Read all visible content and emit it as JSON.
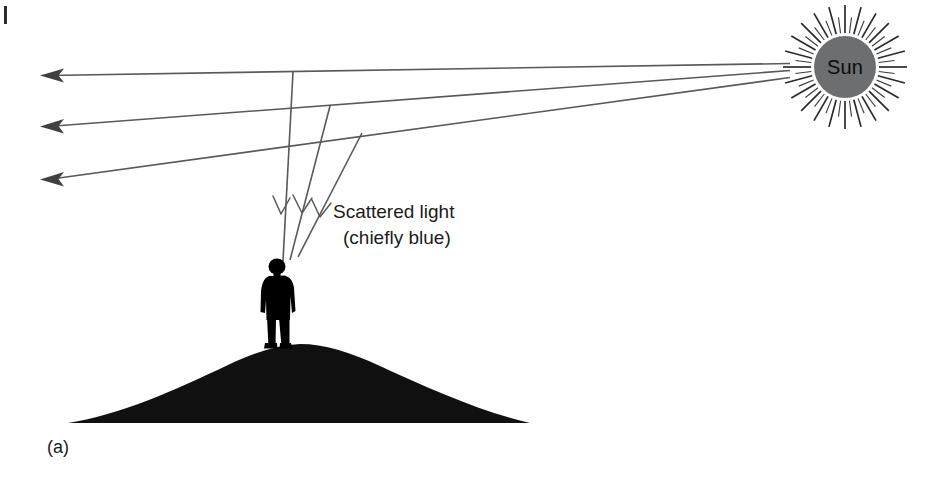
{
  "figure": {
    "panel_label": "(a)",
    "background_color": "#ffffff",
    "width": 943,
    "height": 478,
    "line_color": "#58595b"
  },
  "sun": {
    "label": "Sun",
    "disc_color": "#6d6e70",
    "spike_color": "#2b2b2b",
    "center_x": 845,
    "center_y": 67,
    "disc_radius": 31,
    "spike_outer_radius": 62,
    "spike_count": 48
  },
  "annotations": {
    "scattered_light_line1": "Scattered light",
    "scattered_light_line2": "(chiefly blue)"
  },
  "rays": {
    "incoming_description": "Sunbeams travelling from the Sun toward the left of the frame",
    "arrow_direction": "left",
    "arrow_count": 3,
    "arrow_tip_x": 40,
    "arrow_tip_ys": [
      75,
      126,
      179
    ],
    "scatter_points": [
      {
        "x": 293,
        "y": 72
      },
      {
        "x": 330,
        "y": 106
      },
      {
        "x": 362,
        "y": 133
      }
    ],
    "scattered_arrow_direction": "down",
    "scattered_arrow_count": 3
  },
  "ground": {
    "description": "Dark hill silhouette",
    "color": "#101010",
    "left_x": 68,
    "right_x": 530,
    "base_y": 423,
    "apex_y": 344
  },
  "observer": {
    "description": "Person silhouette standing on hilltop",
    "color": "#000000",
    "x": 263,
    "y": 259,
    "width": 33,
    "height": 90
  },
  "chart_data": {
    "type": "diagram",
    "elements": [
      {
        "name": "Sun",
        "kind": "source",
        "x": 845,
        "y": 67
      },
      {
        "name": "direct sunbeam 1",
        "kind": "ray",
        "from": [
          790,
          63
        ],
        "to": [
          40,
          75
        ]
      },
      {
        "name": "direct sunbeam 2",
        "kind": "ray",
        "from": [
          790,
          70
        ],
        "to": [
          40,
          126
        ]
      },
      {
        "name": "direct sunbeam 3",
        "kind": "ray",
        "from": [
          790,
          77
        ],
        "to": [
          40,
          179
        ]
      },
      {
        "name": "scattered ray 1",
        "kind": "ray",
        "from": [
          293,
          72
        ],
        "to": [
          283,
          260
        ]
      },
      {
        "name": "scattered ray 2",
        "kind": "ray",
        "from": [
          330,
          106
        ],
        "to": [
          290,
          259
        ]
      },
      {
        "name": "scattered ray 3",
        "kind": "ray",
        "from": [
          362,
          133
        ],
        "to": [
          297,
          256
        ]
      },
      {
        "name": "observer",
        "kind": "figure",
        "x": 279,
        "y": 304
      },
      {
        "name": "hill",
        "kind": "terrain",
        "x": 299,
        "y": 384
      }
    ],
    "labels": [
      "Sun",
      "Scattered light",
      "(chiefly blue)",
      "(a)"
    ]
  }
}
